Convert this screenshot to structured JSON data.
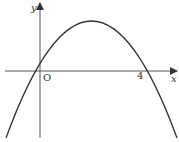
{
  "figure": {
    "type": "parabola-sketch",
    "axes": {
      "x_label": "x",
      "y_label": "y",
      "origin_label": "O"
    },
    "marked_points": [
      {
        "label": "O",
        "x": 0,
        "y": 0
      },
      {
        "label": "4",
        "x": 4,
        "y": 0
      }
    ],
    "curve": {
      "description": "Downward-opening parabola through (0,0) and (4,0), vertex at x = 2",
      "roots": [
        0,
        4
      ],
      "vertex_x": 2,
      "opens": "down"
    },
    "colors": {
      "stroke": "#333333",
      "background": "#ffffff"
    }
  }
}
